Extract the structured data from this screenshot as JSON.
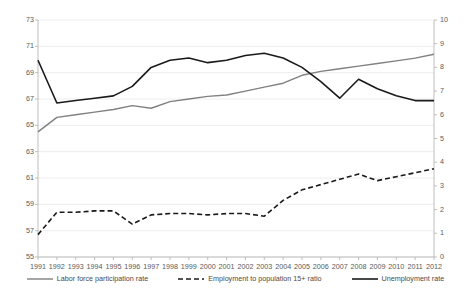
{
  "chart_data": {
    "type": "line",
    "title": "",
    "subtitle": "",
    "xlabel": "",
    "ylabel": "",
    "y2label": "",
    "grid": true,
    "legend_position": "bottom",
    "x": [
      1991,
      1992,
      1993,
      1994,
      1995,
      1996,
      1997,
      1998,
      1999,
      2000,
      2001,
      2002,
      2003,
      2004,
      2005,
      2006,
      2007,
      2008,
      2009,
      2010,
      2011,
      2012
    ],
    "xtick_labels": [
      "1991",
      "1992",
      "1993",
      "1994",
      "1995",
      "1996",
      "1997",
      "1998",
      "1999",
      "2000",
      "2001",
      "2002",
      "2003",
      "2004",
      "2005",
      "2006",
      "2007",
      "2008",
      "2009",
      "2010",
      "2011",
      "2012"
    ],
    "ylim": [
      55,
      73
    ],
    "ytick_labels": [
      "55",
      "57",
      "59",
      "61",
      "63",
      "65",
      "67",
      "69",
      "71",
      "73"
    ],
    "ytick_values": [
      55,
      57,
      59,
      61,
      63,
      65,
      67,
      69,
      71,
      73
    ],
    "y2lim": [
      0,
      10
    ],
    "y2tick_labels": [
      "0",
      "1",
      "2",
      "3",
      "4",
      "5",
      "6",
      "7",
      "8",
      "9",
      "10"
    ],
    "y2tick_values": [
      0,
      1,
      2,
      3,
      4,
      5,
      6,
      7,
      8,
      9,
      10
    ],
    "series": [
      {
        "name": "Labor force participation rate",
        "axis": "left",
        "style": "solid",
        "color": "#808080",
        "width": 1.4,
        "values": [
          64.5,
          65.6,
          65.8,
          66.0,
          66.2,
          66.5,
          66.3,
          66.8,
          67.0,
          67.2,
          67.3,
          67.6,
          67.9,
          68.2,
          68.8,
          69.1,
          69.3,
          69.5,
          69.7,
          69.9,
          70.1,
          70.4
        ]
      },
      {
        "name": "Employment to population 15+ ratio",
        "axis": "left",
        "style": "dashed",
        "color": "#1a1a1a",
        "width": 1.6,
        "values": [
          56.7,
          58.4,
          58.4,
          58.5,
          58.5,
          57.5,
          58.2,
          58.3,
          58.3,
          58.2,
          58.3,
          58.3,
          58.1,
          59.3,
          60.1,
          60.5,
          60.9,
          61.3,
          60.8,
          61.1,
          61.4,
          61.7
        ]
      },
      {
        "name": "Unemployment rate",
        "axis": "right",
        "style": "solid",
        "color": "#1a1a1a",
        "width": 1.6,
        "values": [
          8.3,
          6.5,
          6.6,
          6.7,
          6.8,
          7.2,
          8.0,
          8.3,
          8.4,
          8.2,
          8.3,
          8.5,
          8.6,
          8.4,
          8.0,
          7.4,
          6.7,
          7.5,
          7.1,
          6.8,
          6.6,
          6.6
        ]
      }
    ]
  },
  "legend": {
    "items": [
      {
        "label": "Labor force participation rate"
      },
      {
        "label": "Employment to population 15+ ratio"
      },
      {
        "label": "Unemployment rate"
      }
    ]
  }
}
